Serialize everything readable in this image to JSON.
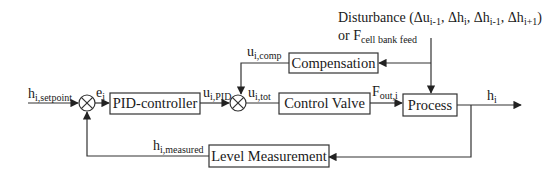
{
  "diagram": {
    "type": "control-loop block diagram",
    "blocks": {
      "pid": "PID-controller",
      "valve": "Control Valve",
      "process": "Process",
      "compensation": "Compensation",
      "level": "Level Measurement"
    },
    "signals": {
      "setpoint": {
        "base": "h",
        "sub": "i,setpoint"
      },
      "error": {
        "base": "e",
        "sub": "i"
      },
      "u_pid": {
        "base": "u",
        "sub": "i,PID"
      },
      "u_comp": {
        "base": "u",
        "sub": "i,comp"
      },
      "u_tot": {
        "base": "u",
        "sub": "i,tot"
      },
      "f_out": {
        "base": "F",
        "sub": "out,i"
      },
      "output": {
        "base": "h",
        "sub": "i"
      },
      "measured": {
        "base": "h",
        "sub": "i,measured"
      }
    },
    "disturbance": {
      "line1_prefix": "Disturbance (",
      "d1": "Δu",
      "d1_sub": "i-1",
      "sep1": ", ",
      "d2": "Δh",
      "d2_sub": "i",
      "sep2": ", ",
      "d3": "Δh",
      "d3_sub": "i-1",
      "sep3": ", ",
      "d4": "Δh",
      "d4_sub": "i+1",
      "line1_suffix": ")",
      "line2_prefix": "or F",
      "line2_sub": "cell bank feed"
    },
    "colors": {
      "stroke": "#333333",
      "text": "#1a1a1a"
    }
  }
}
